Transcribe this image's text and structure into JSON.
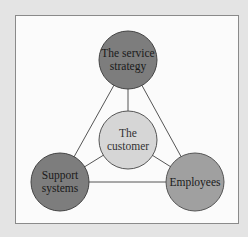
{
  "diagram": {
    "type": "service triangle",
    "nodes": [
      {
        "id": "strategy",
        "lines": [
          "The service",
          "strategy"
        ],
        "color": "#7d7d7d"
      },
      {
        "id": "support",
        "lines": [
          "Support",
          "systems"
        ],
        "color": "#7d7d7d"
      },
      {
        "id": "employees",
        "lines": [
          "Employees"
        ],
        "color": "#a0a0a0"
      },
      {
        "id": "customer",
        "lines": [
          "The",
          "customer"
        ],
        "color": "#d6d6d6"
      }
    ],
    "edges": [
      [
        "strategy",
        "support"
      ],
      [
        "strategy",
        "employees"
      ],
      [
        "support",
        "employees"
      ],
      [
        "strategy",
        "customer"
      ],
      [
        "support",
        "customer"
      ],
      [
        "employees",
        "customer"
      ]
    ]
  }
}
